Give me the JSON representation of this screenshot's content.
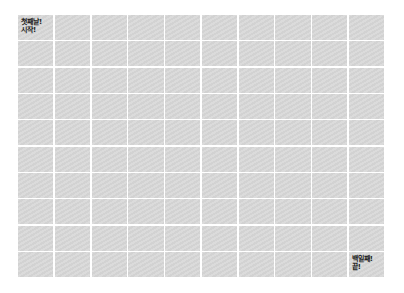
{
  "chart": {
    "rows": 10,
    "cols": 10,
    "cell_color": "#d9d9d9",
    "gap_color": "#ffffff",
    "start_label": "첫째날!\n시작!",
    "end_label": "백일째!\n끝!"
  }
}
